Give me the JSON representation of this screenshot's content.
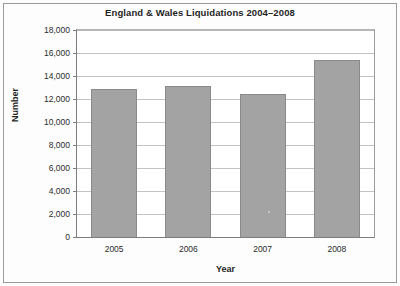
{
  "chart_data": {
    "type": "bar",
    "title": "England & Wales Liquidations 2004–2008",
    "xlabel": "Year",
    "ylabel": "Number",
    "categories": [
      "2005",
      "2006",
      "2007",
      "2008"
    ],
    "values": [
      12900,
      13100,
      12400,
      15400
    ],
    "series": [
      {
        "name": "Liquidations",
        "values": [
          12900,
          13100,
          12400,
          15400
        ]
      }
    ],
    "ylim": [
      0,
      18000
    ],
    "ytick_step": 2000,
    "ytick_labels": [
      "0",
      "2,000",
      "4,000",
      "6,000",
      "8,000",
      "10,000",
      "12,000",
      "14,000",
      "16,000",
      "18,000"
    ],
    "ytick_values": [
      0,
      2000,
      4000,
      6000,
      8000,
      10000,
      12000,
      14000,
      16000,
      18000
    ],
    "grid": true,
    "grid_axis": "y",
    "legend": false,
    "legend_position": "none",
    "bar_color": "#a3a3a3",
    "bar_border_color": "#8a8a8a",
    "gridline_color": "#c3c3c3",
    "axis_color": "#7d7d7d",
    "text_color": "#2b2b2b"
  }
}
